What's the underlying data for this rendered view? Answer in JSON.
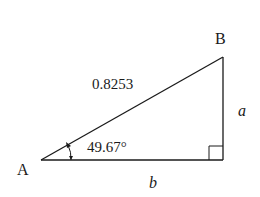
{
  "diagram": {
    "type": "right-triangle",
    "vertices": {
      "A": {
        "label": "A"
      },
      "B": {
        "label": "B"
      }
    },
    "sides": {
      "hypotenuse": {
        "label": "0.8253"
      },
      "opposite": {
        "label": "a"
      },
      "adjacent": {
        "label": "b"
      }
    },
    "angle_A": {
      "label": "49.67°"
    },
    "right_angle_marker": true,
    "colors": {
      "stroke": "#1a1a1a",
      "background": "#ffffff"
    }
  }
}
